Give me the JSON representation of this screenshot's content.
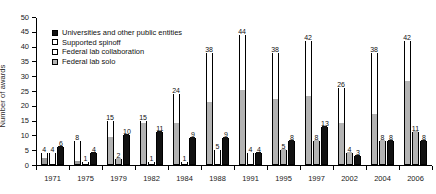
{
  "figure": {
    "cut_caption": "",
    "ylabel": "Number of awards"
  },
  "legend": {
    "position": "top-left-inside",
    "items": [
      {
        "label": "Universities and other public entities",
        "swatch": "solid-black",
        "color": "#111111"
      },
      {
        "label": "Supported spinoff",
        "swatch": "white",
        "color": "#ffffff"
      },
      {
        "label": "Federal lab collaboration",
        "swatch": "white",
        "color": "#ffffff"
      },
      {
        "label": "Federal lab solo",
        "swatch": "hatched-gray",
        "color": "#b3b3b3"
      }
    ]
  },
  "axes": {
    "y_ticks": [
      0,
      5,
      10,
      15,
      20,
      25,
      30,
      35,
      40,
      45,
      50
    ],
    "y_min": 0,
    "y_max": 50,
    "x_categories": [
      "1971",
      "1975",
      "1979",
      "1982",
      "1984",
      "1988",
      "1991",
      "1995",
      "1997",
      "2002",
      "2004",
      "2006"
    ]
  },
  "chart_data": {
    "type": "bar",
    "title": "",
    "xlabel": "",
    "ylabel": "Number of awards",
    "ylim": [
      0,
      50
    ],
    "grid": false,
    "legend_position": "upper left (inside plot)",
    "categories": [
      "1971",
      "1975",
      "1979",
      "1982",
      "1984",
      "1988",
      "1991",
      "1995",
      "1997",
      "2002",
      "2004",
      "2006"
    ],
    "series": [
      {
        "name": "Federal lab (collaboration + supported spinoff stacked)",
        "label_values": [
          4,
          8,
          15,
          15,
          24,
          38,
          44,
          38,
          42,
          26,
          38,
          42
        ],
        "stack_lower_gray": [
          2,
          4,
          9,
          14,
          14,
          21,
          25,
          22,
          23,
          14,
          17,
          28
        ],
        "stack_upper_white": [
          2,
          4,
          6,
          1,
          10,
          17,
          19,
          16,
          19,
          12,
          21,
          14
        ]
      },
      {
        "name": "Middle bar",
        "label_values": [
          4,
          1,
          2,
          1,
          1,
          5,
          4,
          5,
          8,
          4,
          8,
          11
        ]
      },
      {
        "name": "Universities and other public entities",
        "label_values": [
          6,
          4,
          10,
          11,
          9,
          9,
          4,
          8,
          13,
          3,
          8,
          8
        ]
      }
    ]
  },
  "groups": [
    {
      "year": "1971",
      "bars": [
        {
          "label": "4",
          "total": 4,
          "segments": [
            {
              "fill": "gray",
              "value": 2
            },
            {
              "fill": "white",
              "value": 2
            }
          ]
        },
        {
          "label": "4",
          "total": 4,
          "segments": [
            {
              "fill": "white",
              "value": 4
            }
          ]
        },
        {
          "label": "6",
          "total": 6,
          "segments": [
            {
              "fill": "solid",
              "value": 6
            }
          ]
        }
      ]
    },
    {
      "year": "1975",
      "bars": [
        {
          "label": "8",
          "total": 8,
          "segments": [
            {
              "fill": "gray",
              "value": 1
            },
            {
              "fill": "white",
              "value": 7
            }
          ]
        },
        {
          "label": "1",
          "total": 1,
          "segments": [
            {
              "fill": "white",
              "value": 1
            }
          ]
        },
        {
          "label": "4",
          "total": 4,
          "segments": [
            {
              "fill": "solid",
              "value": 4
            }
          ]
        }
      ]
    },
    {
      "year": "1979",
      "bars": [
        {
          "label": "15",
          "total": 15,
          "segments": [
            {
              "fill": "hatch",
              "value": 9
            },
            {
              "fill": "white",
              "value": 6
            }
          ]
        },
        {
          "label": "2",
          "total": 2,
          "segments": [
            {
              "fill": "hatch",
              "value": 2
            }
          ]
        },
        {
          "label": "10",
          "total": 10,
          "segments": [
            {
              "fill": "solid",
              "value": 10
            }
          ]
        }
      ]
    },
    {
      "year": "1982",
      "bars": [
        {
          "label": "15",
          "total": 15,
          "segments": [
            {
              "fill": "hatch",
              "value": 14
            },
            {
              "fill": "white",
              "value": 1
            }
          ]
        },
        {
          "label": "1",
          "total": 1,
          "segments": [
            {
              "fill": "white",
              "value": 1
            }
          ]
        },
        {
          "label": "11",
          "total": 11,
          "segments": [
            {
              "fill": "solid",
              "value": 11
            }
          ]
        }
      ]
    },
    {
      "year": "1984",
      "bars": [
        {
          "label": "24",
          "total": 24,
          "segments": [
            {
              "fill": "hatch",
              "value": 14
            },
            {
              "fill": "white",
              "value": 10
            }
          ]
        },
        {
          "label": "1",
          "total": 1,
          "segments": [
            {
              "fill": "white",
              "value": 1
            }
          ]
        },
        {
          "label": "9",
          "total": 9,
          "segments": [
            {
              "fill": "solid",
              "value": 9
            }
          ]
        }
      ]
    },
    {
      "year": "1988",
      "bars": [
        {
          "label": "38",
          "total": 38,
          "segments": [
            {
              "fill": "hatch",
              "value": 21
            },
            {
              "fill": "white",
              "value": 17
            }
          ]
        },
        {
          "label": "5",
          "total": 5,
          "segments": [
            {
              "fill": "white",
              "value": 5
            }
          ]
        },
        {
          "label": "9",
          "total": 9,
          "segments": [
            {
              "fill": "solid",
              "value": 9
            }
          ]
        }
      ]
    },
    {
      "year": "1991",
      "bars": [
        {
          "label": "44",
          "total": 44,
          "segments": [
            {
              "fill": "hatch",
              "value": 25
            },
            {
              "fill": "white",
              "value": 19
            }
          ]
        },
        {
          "label": "4",
          "total": 4,
          "segments": [
            {
              "fill": "white",
              "value": 4
            }
          ]
        },
        {
          "label": "4",
          "total": 4,
          "segments": [
            {
              "fill": "solid",
              "value": 4
            }
          ]
        }
      ]
    },
    {
      "year": "1995",
      "bars": [
        {
          "label": "38",
          "total": 38,
          "segments": [
            {
              "fill": "hatch",
              "value": 22
            },
            {
              "fill": "white",
              "value": 16
            }
          ]
        },
        {
          "label": "5",
          "total": 5,
          "segments": [
            {
              "fill": "hatch",
              "value": 5
            }
          ]
        },
        {
          "label": "8",
          "total": 8,
          "segments": [
            {
              "fill": "solid",
              "value": 8
            }
          ]
        }
      ]
    },
    {
      "year": "1997",
      "bars": [
        {
          "label": "42",
          "total": 42,
          "segments": [
            {
              "fill": "hatch",
              "value": 23
            },
            {
              "fill": "white",
              "value": 19
            }
          ]
        },
        {
          "label": "8",
          "total": 8,
          "segments": [
            {
              "fill": "hatch",
              "value": 8
            }
          ]
        },
        {
          "label": "13",
          "total": 13,
          "segments": [
            {
              "fill": "solid",
              "value": 13
            }
          ]
        }
      ]
    },
    {
      "year": "2002",
      "bars": [
        {
          "label": "26",
          "total": 26,
          "segments": [
            {
              "fill": "hatch",
              "value": 14
            },
            {
              "fill": "white",
              "value": 12
            }
          ]
        },
        {
          "label": "4",
          "total": 4,
          "segments": [
            {
              "fill": "hatch",
              "value": 4
            }
          ]
        },
        {
          "label": "3",
          "total": 3,
          "segments": [
            {
              "fill": "solid",
              "value": 3
            }
          ]
        }
      ]
    },
    {
      "year": "2004",
      "bars": [
        {
          "label": "38",
          "total": 38,
          "segments": [
            {
              "fill": "hatch",
              "value": 17
            },
            {
              "fill": "white",
              "value": 21
            }
          ]
        },
        {
          "label": "8",
          "total": 8,
          "segments": [
            {
              "fill": "hatch",
              "value": 8
            }
          ]
        },
        {
          "label": "8",
          "total": 8,
          "segments": [
            {
              "fill": "solid",
              "value": 8
            }
          ]
        }
      ]
    },
    {
      "year": "2006",
      "bars": [
        {
          "label": "42",
          "total": 42,
          "segments": [
            {
              "fill": "hatch",
              "value": 28
            },
            {
              "fill": "white",
              "value": 14
            }
          ]
        },
        {
          "label": "11",
          "total": 11,
          "segments": [
            {
              "fill": "hatch",
              "value": 11
            }
          ]
        },
        {
          "label": "8",
          "total": 8,
          "segments": [
            {
              "fill": "solid",
              "value": 8
            }
          ]
        }
      ]
    }
  ]
}
